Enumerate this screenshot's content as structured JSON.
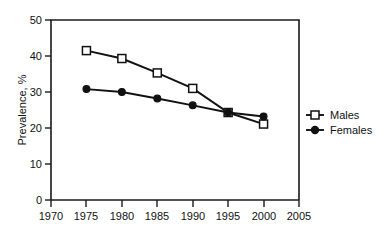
{
  "chart_data": {
    "type": "line",
    "title": "",
    "subtitle": "",
    "xlabel": "",
    "ylabel": "Prevalence, %",
    "x": [
      1975,
      1980,
      1985,
      1990,
      1995,
      2000
    ],
    "xlim": [
      1970,
      2005
    ],
    "ylim": [
      0,
      50
    ],
    "xticks": [
      1970,
      1975,
      1980,
      1985,
      1990,
      1995,
      2000,
      2005
    ],
    "yticks": [
      0,
      10,
      20,
      30,
      40,
      50
    ],
    "xtick_labels": [
      "1970",
      "1975",
      "1980",
      "1985",
      "1990",
      "1995",
      "2000",
      "2005"
    ],
    "ytick_labels": [
      "0",
      "10",
      "20",
      "30",
      "40",
      "50"
    ],
    "grid": false,
    "legend_position": "right",
    "series": [
      {
        "name": "Males",
        "marker": "open-square",
        "color": "#111111",
        "values": [
          41.5,
          39.3,
          35.3,
          31.0,
          24.3,
          21.1
        ]
      },
      {
        "name": "Females",
        "marker": "filled-circle",
        "color": "#111111",
        "values": [
          30.8,
          30.0,
          28.2,
          26.3,
          24.3,
          23.2
        ]
      }
    ],
    "annotations": []
  },
  "legend": {
    "entries": [
      {
        "label": "Males",
        "marker": "open-square"
      },
      {
        "label": "Females",
        "marker": "filled-circle"
      }
    ]
  }
}
